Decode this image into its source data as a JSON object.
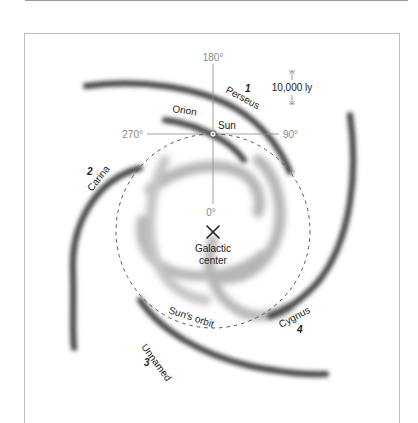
{
  "diagram": {
    "axes": {
      "top": "180°",
      "right": "90°",
      "left": "270°",
      "bottom": "0°"
    },
    "scale_bar": {
      "label": "10,000 ly"
    },
    "sun": {
      "label": "Sun"
    },
    "center": {
      "label_line1": "Galactic",
      "label_line2": "center"
    },
    "orbit": {
      "label": "Sun's orbit"
    },
    "arms": [
      {
        "number": "1",
        "name": "Perseus"
      },
      {
        "number": "2",
        "name": "Carina"
      },
      {
        "number": "3",
        "name": "Unnamed"
      },
      {
        "number": "4",
        "name": "Cygnus"
      },
      {
        "number": "",
        "name": "Orion"
      }
    ],
    "colors": {
      "arm_dark": "#3a3a3a",
      "arm_inner": "#b0b0b0",
      "axis": "#8a8a8a",
      "frame": "#bdbdbd"
    }
  }
}
